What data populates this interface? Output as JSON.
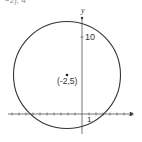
{
  "figure": {
    "top_text_fragment": "−2), 4",
    "axes": {
      "x_label": "x",
      "y_label": "y",
      "y_tick_label": "10",
      "x_tick_label": "1"
    },
    "circle": {
      "center_label": "(-2,5)",
      "center": [
        -2,
        5
      ],
      "stroke_color": "#333333"
    },
    "colors": {
      "background": "#ffffff",
      "ink": "#333333"
    }
  }
}
